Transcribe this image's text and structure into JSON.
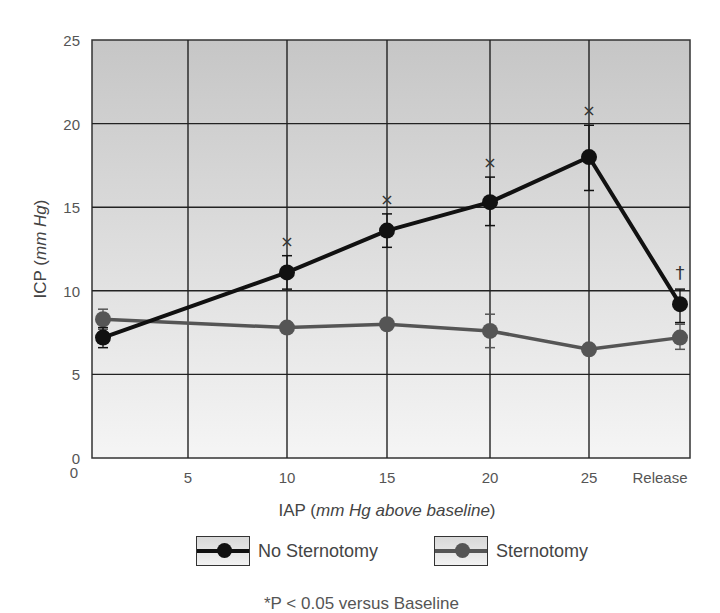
{
  "chart_data": {
    "type": "line",
    "title": "",
    "xlabel": "IAP (mm Hg above baseline)",
    "xlabel_parts": {
      "prefix": "IAP (",
      "italic": "mm Hg above baseline",
      "suffix": ")"
    },
    "ylabel": "ICP (mm Hg)",
    "ylabel_parts": {
      "prefix": "ICP (",
      "italic": "mm Hg",
      "suffix": ")"
    },
    "ylim": [
      0,
      25
    ],
    "yticks": [
      0,
      5,
      10,
      15,
      20,
      25
    ],
    "xtick_labels": [
      "5",
      "10",
      "15",
      "20",
      "25",
      "Release"
    ],
    "x_origin_label": "0",
    "grid": true,
    "categories": [
      "Baseline",
      "10",
      "15",
      "20",
      "25",
      "Release"
    ],
    "series": [
      {
        "name": "No Sternotomy",
        "color": "#111111",
        "values": [
          7.2,
          11.1,
          13.6,
          15.3,
          18.0,
          9.2
        ],
        "error_low": [
          6.6,
          10.1,
          12.6,
          13.9,
          16.0,
          8.1
        ],
        "error_high": [
          7.8,
          12.1,
          14.6,
          16.8,
          19.9,
          10.1
        ],
        "markers": [
          "",
          "*",
          "*",
          "*",
          "*",
          "†"
        ]
      },
      {
        "name": "Sternotomy",
        "color": "#555555",
        "values": [
          8.3,
          7.8,
          8.0,
          7.6,
          6.5,
          7.2
        ],
        "error_low": [
          7.7,
          7.8,
          8.0,
          6.6,
          6.5,
          6.5
        ],
        "error_high": [
          8.9,
          7.8,
          8.0,
          8.6,
          6.5,
          8.0
        ]
      }
    ],
    "legend": [
      "No Sternotomy",
      "Sternotomy"
    ],
    "legend_position": "bottom",
    "annotations": [
      "*P < 0.05 versus Baseline"
    ]
  },
  "legend": {
    "no_sternotomy": "No Sternotomy",
    "sternotomy": "Sternotomy"
  },
  "footnote": "*P < 0.05 versus Baseline",
  "colors": {
    "no_sternotomy": "#111111",
    "sternotomy": "#555555",
    "grid": "#222222",
    "bg_top": "#c6c6c6",
    "bg_bottom": "#f5f5f5"
  }
}
